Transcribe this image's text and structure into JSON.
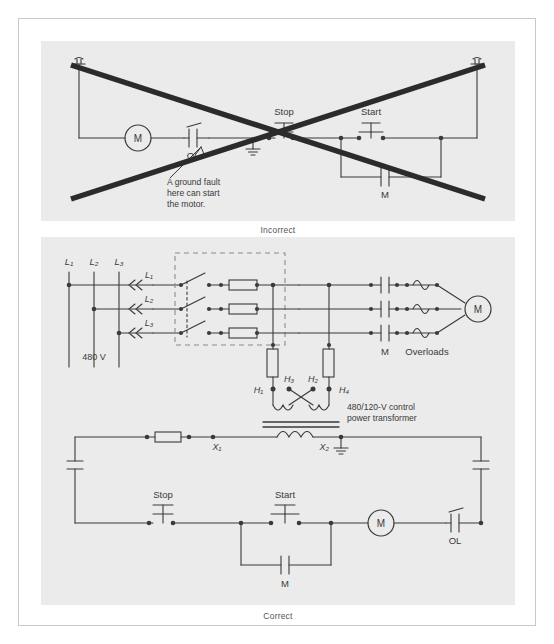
{
  "figure": {
    "panels": [
      {
        "id": "incorrect",
        "caption": "Incorrect",
        "crossed_out": true,
        "labels": {
          "motor": "M",
          "overload": "OL",
          "stop": "Stop",
          "start": "Start",
          "coil_contact": "M",
          "callout_line1": "A ground fault",
          "callout_line2": "here can start",
          "callout_line3": "the motor."
        }
      },
      {
        "id": "correct",
        "caption": "Correct",
        "crossed_out": false,
        "power": {
          "supply_lines": [
            "L₁",
            "L₂",
            "L₃"
          ],
          "feeder_lines": [
            "L₁",
            "L₂",
            "L₃"
          ],
          "voltage": "480 V",
          "contactor": "M",
          "overloads": "Overloads",
          "motor": "M"
        },
        "transformer": {
          "primary_terminals": [
            "H₁",
            "H₃",
            "H₂",
            "H₄"
          ],
          "secondary_terminals": [
            "X₁",
            "X₂"
          ],
          "description_line1": "480/120-V control",
          "description_line2": "power transformer"
        },
        "control": {
          "stop": "Stop",
          "start": "Start",
          "seal_in": "M",
          "motor_starter_coil": "M",
          "overload": "OL"
        }
      }
    ]
  },
  "colors": {
    "panel_bg": "#ebebeb",
    "page_bg": "#ffffff",
    "wire": "#3a3a3a",
    "cross_out": "#2b2b2b",
    "frame_border": "#c9c9c9",
    "caption_text": "#555555",
    "dashed_enclosure": "#8a8a8a"
  }
}
